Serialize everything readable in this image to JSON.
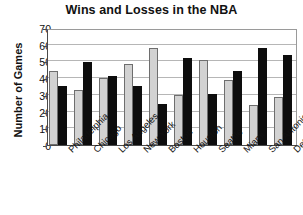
{
  "chart_data": {
    "type": "bar",
    "title": "Wins and Losses in the NBA",
    "xlabel": "",
    "ylabel": "Number of Games",
    "ylim": [
      0,
      70
    ],
    "ytick_values": [
      0,
      10,
      20,
      30,
      40,
      50,
      60,
      70
    ],
    "ytick_labels": [
      "0",
      "10",
      "20",
      "30",
      "40",
      "50",
      "60",
      "70"
    ],
    "grid": true,
    "legend": "none",
    "categories": [
      "Philadelphia",
      "Chicago",
      "Los Angeles",
      "New York",
      "Boston",
      "Houston",
      "Seattle",
      "Miami",
      "San Antonio",
      "Detroit"
    ],
    "series": [
      {
        "name": "Wins",
        "color": "#d2d2d2",
        "values": [
          44,
          33,
          40,
          48.5,
          58,
          30,
          51,
          39,
          24,
          29
        ]
      },
      {
        "name": "Losses",
        "color": "#0d0d0d",
        "values": [
          35.5,
          49.5,
          41.5,
          35.5,
          24.5,
          52,
          30.5,
          44,
          58,
          54
        ]
      }
    ]
  },
  "colors": {
    "wins_bar": "#d2d2d2",
    "losses_bar": "#0d0d0d",
    "gridline": "#b6b6b6",
    "axis": "#4a4a4a",
    "text": "#111111",
    "background": "#ffffff"
  }
}
